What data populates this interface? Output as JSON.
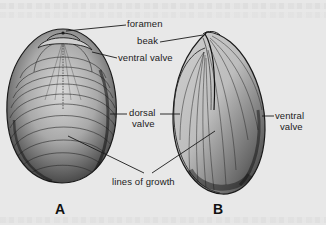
{
  "figure": {
    "panels": [
      {
        "id": "A",
        "letter": "A",
        "view": "dorsal view of brachiopod shell"
      },
      {
        "id": "B",
        "letter": "B",
        "view": "side view of brachiopod shell"
      }
    ],
    "labels": {
      "foramen": "foramen",
      "ventral_valve_a": "ventral valve",
      "beak": "beak",
      "dorsal_line1": "dorsal",
      "dorsal_line2": "valve",
      "ventral_b_line1": "ventral",
      "ventral_b_line2": "valve",
      "lines_of_growth": "lines of growth"
    },
    "colors": {
      "background": "#e8e8e8",
      "ink": "#1a1a1a",
      "shade": "#8a8a8a"
    }
  }
}
